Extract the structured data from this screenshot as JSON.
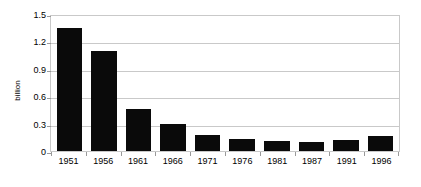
{
  "chart_data": {
    "type": "bar",
    "title": "",
    "subtitle": "",
    "xlabel": "",
    "ylabel": "billion",
    "categories": [
      "1951",
      "1956",
      "1961",
      "1966",
      "1971",
      "1976",
      "1981",
      "1987",
      "1991",
      "1996"
    ],
    "values": [
      1.35,
      1.1,
      0.46,
      0.3,
      0.18,
      0.13,
      0.11,
      0.1,
      0.12,
      0.16
    ],
    "series": [
      {
        "name": "",
        "values": [
          1.35,
          1.1,
          0.46,
          0.3,
          0.18,
          0.13,
          0.11,
          0.1,
          0.12,
          0.16
        ]
      }
    ],
    "ylim": [
      0,
      1.5
    ],
    "yticks": [
      0,
      0.3,
      0.6,
      0.9,
      1.2,
      1.5
    ],
    "ytick_labels": [
      "0",
      "0.3",
      "0.6",
      "0.9",
      "1.2",
      "1.5"
    ],
    "grid": "horizontal",
    "legend": "none",
    "bar_color": "#0a0a0a",
    "grid_color": "#c9c9c9",
    "background_color": "#ffffff",
    "axis_text_color": "#000000"
  }
}
